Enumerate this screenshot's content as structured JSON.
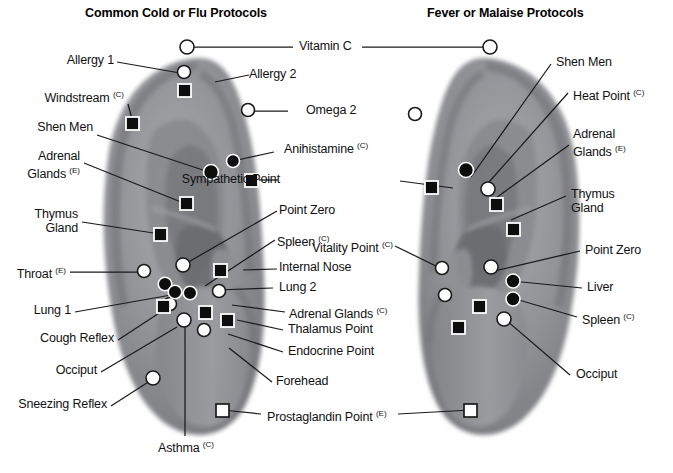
{
  "figure": {
    "type": "auriculotherapy-ear-point-diagram",
    "background": "#ffffff",
    "line_color": "#1a1a1a",
    "ear_fill_mid": "#8f9094",
    "ear_fill_dark": "#6c6d71",
    "ear_fill_light": "#b9babd"
  },
  "titles": {
    "left": "Common Cold or Flu Protocols",
    "right": "Fever or Malaise Protocols"
  },
  "shared_labels": [
    {
      "name": "vitamin-c",
      "text": "Vitamin C",
      "sup": ""
    },
    {
      "name": "prostaglandin-point",
      "text": "Prostaglandin Point ",
      "sup": "(E)"
    }
  ],
  "left_ear": {
    "name": "left-ear-common-cold-or-flu",
    "labels": [
      {
        "id": "allergy-1",
        "text": "Allergy 1",
        "sup": "",
        "marker": "open-circle"
      },
      {
        "id": "allergy-2",
        "text": "Allergy 2",
        "sup": "",
        "marker": "filled-square"
      },
      {
        "id": "windstream",
        "text": "Windstream ",
        "sup": "(C)",
        "marker": "filled-square"
      },
      {
        "id": "shen-men",
        "text": "Shen Men",
        "sup": "",
        "marker": "filled-circle"
      },
      {
        "id": "adrenal-glands-e",
        "text": "Adrenal",
        "text2": "Glands ",
        "sup": "(E)",
        "marker": "filled-square"
      },
      {
        "id": "thymus-gland",
        "text": "Thymus",
        "text2": "Gland",
        "sup": "",
        "marker": "filled-square"
      },
      {
        "id": "throat-e",
        "text": "Throat ",
        "sup": "(E)",
        "marker": "open-circle"
      },
      {
        "id": "lung-1",
        "text": "Lung 1",
        "sup": "",
        "marker": "filled-square"
      },
      {
        "id": "cough-reflex",
        "text": "Cough Reflex",
        "sup": "",
        "marker": "filled-circle"
      },
      {
        "id": "occiput-left",
        "text": "Occiput",
        "sup": "",
        "marker": "open-circle"
      },
      {
        "id": "sneezing-reflex",
        "text": "Sneezing Reflex",
        "sup": "",
        "marker": "open-circle"
      },
      {
        "id": "asthma",
        "text": "Asthma ",
        "sup": "(C)",
        "marker": "open-circle"
      },
      {
        "id": "omega-2",
        "text": "Omega 2",
        "sup": "",
        "marker": "open-circle"
      },
      {
        "id": "anihistamine",
        "text": "Anihistamine ",
        "sup": "(C)",
        "marker": "filled-circle"
      },
      {
        "id": "sympathetic-point",
        "text": "Sympathetic Point",
        "sup": "",
        "marker": "filled-square"
      },
      {
        "id": "point-zero-left",
        "text": "Point Zero",
        "sup": "",
        "marker": "open-circle"
      },
      {
        "id": "spleen-c-left",
        "text": "Spleen ",
        "sup": "(C)",
        "marker": "filled-circle"
      },
      {
        "id": "internal-nose",
        "text": "Internal Nose",
        "sup": "",
        "marker": "filled-circle"
      },
      {
        "id": "lung-2",
        "text": "Lung 2",
        "sup": "",
        "marker": "filled-circle"
      },
      {
        "id": "adrenal-glands-c-left",
        "text": "Adrenal Glands ",
        "sup": "(C)",
        "marker": "filled-square"
      },
      {
        "id": "thalamus-point",
        "text": "Thalamus Point",
        "sup": "",
        "marker": "filled-square"
      },
      {
        "id": "endocrine-point",
        "text": "Endocrine Point",
        "sup": "",
        "marker": "filled-square"
      },
      {
        "id": "forehead",
        "text": "Forehead",
        "sup": "",
        "marker": "open-circle"
      }
    ]
  },
  "right_ear": {
    "name": "right-ear-fever-or-malaise",
    "labels": [
      {
        "id": "shen-men-right",
        "text": "Shen Men",
        "sup": "",
        "marker": "filled-circle"
      },
      {
        "id": "heat-point",
        "text": "Heat Point ",
        "sup": "(C)",
        "marker": "open-circle"
      },
      {
        "id": "adrenal-glands-e-right",
        "text": "Adrenal",
        "text2": "Glands ",
        "sup": "(E)",
        "marker": "filled-square"
      },
      {
        "id": "thymus-gland-right",
        "text": "Thymus",
        "text2": "Gland",
        "sup": "",
        "marker": "filled-square"
      },
      {
        "id": "point-zero-right",
        "text": "Point Zero",
        "sup": "",
        "marker": "open-circle"
      },
      {
        "id": "liver",
        "text": "Liver",
        "sup": "",
        "marker": "filled-circle"
      },
      {
        "id": "spleen-c-right",
        "text": "Spleen ",
        "sup": "(C)",
        "marker": "filled-circle"
      },
      {
        "id": "occiput-right",
        "text": "Occiput",
        "sup": "",
        "marker": "open-circle"
      },
      {
        "id": "vitality-point",
        "text": "Vitality Point ",
        "sup": "(C)",
        "marker": "open-circle"
      },
      {
        "id": "sympathetic-point-right",
        "text": "Sympathetic Point",
        "sup": "",
        "marker": "filled-square"
      },
      {
        "id": "adrenal-glands-c-right",
        "text": "Adrenal Glands ",
        "sup": "(C)",
        "marker": "open-circle"
      },
      {
        "id": "thalamus-point-right",
        "text": "Thalamus Point",
        "sup": "",
        "marker": "filled-square"
      },
      {
        "id": "endocrine-point-right",
        "text": "Endocrine Point",
        "sup": "",
        "marker": "filled-square"
      }
    ]
  },
  "marker_legend": {
    "open-circle": "hollow white circle with dark outline",
    "filled-circle": "solid black circle with white ring",
    "filled-square": "solid black square with white border",
    "open-square": "hollow white square with dark outline"
  }
}
